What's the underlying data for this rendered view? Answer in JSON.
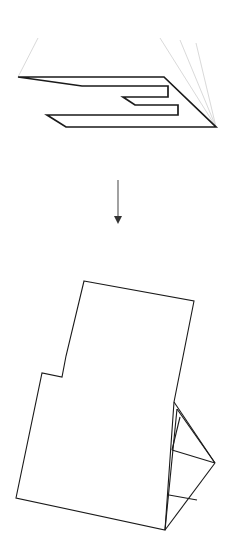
{
  "figure": {
    "background_color": "#ffffff",
    "canvas": {
      "width": 231,
      "height": 552
    },
    "stroke_colors": {
      "heavy_edge": "#1a1a1a",
      "thin_edge": "#2b2b2b",
      "guide": "#cfcfcf",
      "arrow": "#555555",
      "face_fill": "#ffffff"
    },
    "stroke_widths": {
      "heavy_edge": 1.6,
      "thin_edge": 1.0,
      "guide": 0.7,
      "arrow_shaft": 1.0
    }
  },
  "top_panel": {
    "label": "isometric-g-plate",
    "description": "Flat G-shaped plate drawn in oblique 3D projection",
    "outline_points": "18,77 164,77 202,111 216,127 66,127 47,115 178,115 178,105 135,105 123,97 168,97 168,86 82,86 67,77",
    "outline_path": "M 18,77 L 164,77 L 216,127 L 66,127 L 47,115 L 178,115 L 178,105 L 135,105 L 123,97 L 168,97 L 168,86 L 82,86 Z",
    "guides": [
      {
        "name": "guide-left",
        "d": "M 38,38 L 18,77"
      },
      {
        "name": "guide-right-inner",
        "d": "M 160,38 L 216,127"
      },
      {
        "name": "guide-right-middle",
        "d": "M 180,40 L 216,127"
      },
      {
        "name": "guide-right-outer",
        "d": "M 196,43 L 216,127"
      }
    ]
  },
  "arrow": {
    "label": "downward-transform-arrow",
    "shaft_d": "M 118,180 L 118,216",
    "head_points": "114,216 122,216 118,224",
    "direction": "down"
  },
  "bottom_panel": {
    "label": "unfolded-net",
    "description": "Flattened unfolded net of the plate with folded triangular flap at right",
    "main_outline_d": "M 84,281 L 194,301 L 174,402 L 165,530 L 16,498 L 42,373 L 62,377 L 66,356 Z",
    "flap_edges": [
      {
        "name": "flap-upper-diagonal",
        "d": "M 177,409 L 215,463"
      },
      {
        "name": "flap-upper-inner",
        "d": "M 174,402 L 215,463"
      },
      {
        "name": "flap-crease-upper",
        "d": "M 180,417 L 172,450"
      },
      {
        "name": "flap-crease-mid",
        "d": "M 172,450 L 215,463"
      },
      {
        "name": "flap-crease-lower",
        "d": "M 169,495 L 197,500"
      },
      {
        "name": "flap-lower-diagonal",
        "d": "M 215,463 L 165,530"
      },
      {
        "name": "flap-left-fold",
        "d": "M 177,409 L 165,530"
      }
    ]
  }
}
